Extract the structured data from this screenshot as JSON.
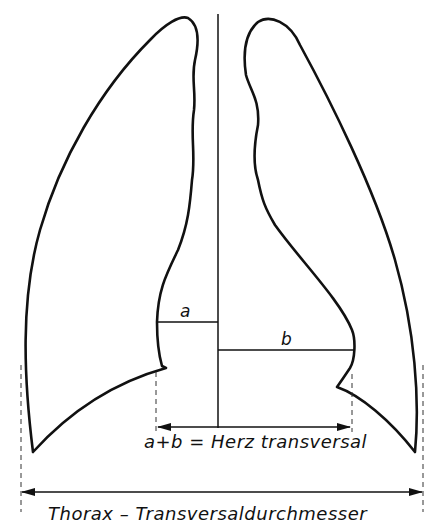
{
  "diagram": {
    "labels": {
      "a": "a",
      "b": "b",
      "heart_transverse": "a+b = Herz transversal",
      "thorax_transverse": "Thorax – Transversaldurchmesser"
    },
    "elements": [
      "left-lung-outline",
      "right-lung-outline",
      "midline",
      "segment-a",
      "segment-b",
      "heart-transverse-arrow",
      "thorax-transverse-arrow"
    ],
    "colors": {
      "line": "#111111",
      "background": "#ffffff"
    }
  }
}
